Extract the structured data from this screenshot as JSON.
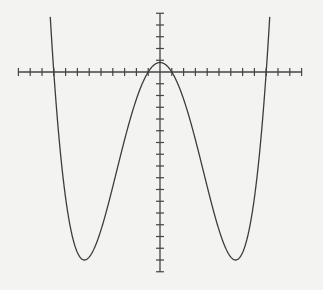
{
  "chart_data": {
    "type": "line",
    "title": "",
    "xlabel": "",
    "ylabel": "",
    "function": "y = 0.01 (x^2 - 1)(x^2 - 81)",
    "series": [
      {
        "name": "quartic curve",
        "x": [
          -9.4,
          -9,
          -8,
          -7,
          -6.4,
          -6,
          -5,
          -4,
          -3,
          -2,
          -1,
          0,
          1,
          2,
          3,
          4,
          5,
          6,
          6.4,
          7,
          8,
          9,
          9.4
        ],
        "y": [
          5.08,
          0,
          -10.71,
          -15.36,
          -16.0,
          -15.75,
          -13.44,
          -9.75,
          -5.76,
          -2.31,
          0,
          0.81,
          0,
          -2.31,
          -5.76,
          -9.75,
          -13.44,
          -15.75,
          -16.0,
          -15.36,
          -10.71,
          0,
          5.08
        ]
      }
    ],
    "key_points": {
      "local_max": [
        0,
        0.81
      ],
      "local_min": [
        [
          -6.4,
          -16
        ],
        [
          6.4,
          -16
        ]
      ],
      "x_intercepts": [
        -9,
        -1,
        1,
        9
      ]
    },
    "xlim": [
      -12,
      12
    ],
    "ylim": [
      -17,
      5
    ],
    "x_tick_step": 1,
    "y_tick_step": 1,
    "grid": false,
    "legend": null,
    "tick_labels": "none",
    "colors": {
      "background": "#f3f3f2",
      "axis": "#444444",
      "curve": "#3c3c3c"
    }
  }
}
